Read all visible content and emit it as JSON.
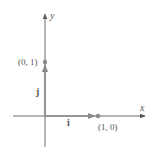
{
  "diagram": {
    "type": "coordinate-axes-unit-vectors",
    "axes": {
      "x_label": "x",
      "y_label": "y"
    },
    "points": [
      {
        "label": "(0, 1)",
        "x": 0,
        "y": 1
      },
      {
        "label": "(1, 0)",
        "x": 1,
        "y": 0
      }
    ],
    "vectors": [
      {
        "name": "i",
        "label": "i",
        "from": [
          0,
          0
        ],
        "to": [
          1,
          0
        ]
      },
      {
        "name": "j",
        "label": "j",
        "from": [
          0,
          0
        ],
        "to": [
          0,
          1
        ]
      }
    ],
    "colors": {
      "axis": "#6b6b6b",
      "vector": "#8a8a8a",
      "point": "#8a8a8a",
      "text": "#555555"
    }
  }
}
